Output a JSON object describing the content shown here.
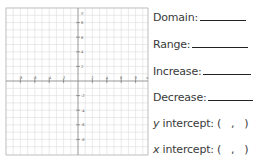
{
  "graph": {
    "x_ticks": [
      "-8",
      "-6",
      "-4",
      "-2",
      "2",
      "4",
      "6",
      "8"
    ],
    "y_ticks": [
      "8",
      "6",
      "4",
      "2",
      "-2",
      "-4",
      "-6",
      "-8"
    ],
    "x_axis_label": "x",
    "y_axis_label": "y",
    "grid_color": "#d9d9d9",
    "axis_color": "#9a9a9a"
  },
  "questions": [
    {
      "label": "Domain:",
      "type": "blank"
    },
    {
      "label": "Range:",
      "type": "blank"
    },
    {
      "label": "Increase:",
      "type": "blank"
    },
    {
      "label": "Decrease:",
      "type": "blank"
    },
    {
      "var": "y",
      "label": " intercept: (   ,   )",
      "type": "point"
    },
    {
      "var": "x",
      "label": " intercept: (   ,   )",
      "type": "point"
    }
  ]
}
